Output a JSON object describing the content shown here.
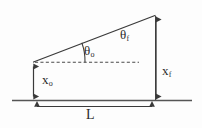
{
  "diagram": {
    "kind": "projectile-launch-geometry-triangle",
    "stroke_color": "#3a3a3a",
    "ground_color": "#555555",
    "background_color": "#fdfdfd",
    "labels": {
      "theta_initial": {
        "symbol": "θ",
        "subscript": "o"
      },
      "theta_final": {
        "symbol": "θ",
        "subscript": "f"
      },
      "x_initial": {
        "symbol": "x",
        "subscript": "o"
      },
      "x_final": {
        "symbol": "x",
        "subscript": "f"
      },
      "length": {
        "symbol": "L",
        "subscript": ""
      }
    },
    "geometry": {
      "left_vertex": [
        33,
        62
      ],
      "apex": [
        155,
        15
      ],
      "right_base": [
        155,
        100
      ],
      "ground_line": {
        "x1": 12,
        "x2": 192,
        "y": 100
      },
      "dashed_horizontal": {
        "x1": 35,
        "x2": 138,
        "y": 62
      },
      "x_initial_arrow": {
        "x": 33,
        "y1": 62,
        "y2": 100
      },
      "x_final_arrow": {
        "x": 156,
        "y1": 15,
        "y2": 100
      },
      "length_arrow": {
        "y": 106,
        "x1": 33,
        "x2": 156
      },
      "theta_initial_arc": {
        "cx": 33,
        "cy": 62,
        "radius": 52
      }
    }
  }
}
